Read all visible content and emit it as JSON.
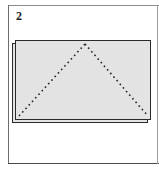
{
  "figure": {
    "step_number": "2",
    "caption": "",
    "type": "origami-fold-step",
    "frame": {
      "border_color": "#6e6e6e",
      "background": "#ffffff"
    },
    "paper": {
      "fill_color": "#e3e3e3",
      "outline_color": "#2a2a2a",
      "shape": "rectangle",
      "layers": 2,
      "under_layer_label": "lower sheet edge",
      "top_layer_label": "top sheet"
    },
    "fold_guides": {
      "style": "dotted",
      "color": "#262626",
      "label": "valley fold guide lines",
      "segments": [
        {
          "name": "left-diagonal",
          "from": "bottom-left-corner",
          "to": "top-apex"
        },
        {
          "name": "right-diagonal",
          "from": "top-apex",
          "to": "bottom-right-corner"
        }
      ],
      "apex_position": "top-center"
    }
  },
  "geometry": {
    "paper_width": 136,
    "paper_height": 80,
    "apex_x": 70,
    "apex_y": 4,
    "left_base_x": 4,
    "right_base_x": 133,
    "base_y": 76
  }
}
